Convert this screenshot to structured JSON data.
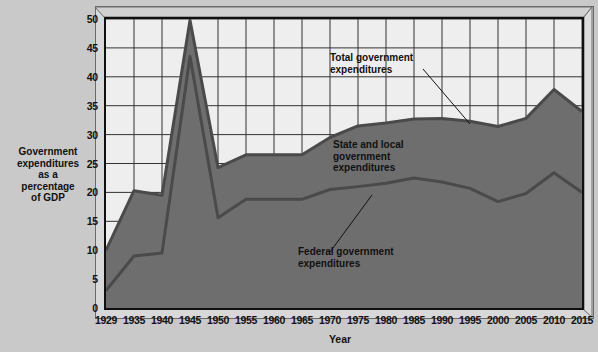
{
  "chart_data": {
    "type": "area",
    "title": "",
    "xlabel": "Year",
    "ylabel": "Government expenditures as a percentage of GDP",
    "ylim": [
      0,
      50
    ],
    "ytick_step": 5,
    "yticks": [
      0,
      5,
      10,
      15,
      20,
      25,
      30,
      35,
      40,
      45,
      50
    ],
    "grid": true,
    "legend_position": "inline-annotations",
    "categories": [
      1929,
      1935,
      1940,
      1945,
      1950,
      1955,
      1960,
      1965,
      1970,
      1975,
      1980,
      1985,
      1990,
      1995,
      2000,
      2005,
      2010,
      2015
    ],
    "xticks": [
      "1929",
      "1935",
      "1940",
      "1945",
      "1950",
      "1955",
      "1960",
      "1965",
      "1970",
      "1975",
      "1980",
      "1985",
      "1990",
      "1995",
      "2000",
      "2005",
      "2010",
      "2015"
    ],
    "series": [
      {
        "name": "Total government expenditures",
        "values": [
          10.0,
          20.3,
          19.5,
          49.8,
          24.3,
          26.5,
          26.5,
          26.5,
          29.5,
          31.5,
          32.0,
          32.7,
          32.8,
          32.3,
          31.4,
          32.8,
          37.8,
          34.0
        ]
      },
      {
        "name": "Federal government expenditures",
        "values": [
          3.0,
          9.0,
          9.5,
          43.5,
          15.6,
          18.8,
          18.8,
          18.8,
          20.5,
          21.0,
          21.6,
          22.5,
          21.8,
          20.7,
          18.4,
          19.8,
          23.4,
          20.0
        ]
      }
    ],
    "derived_series": [
      {
        "name": "State and local government expenditures",
        "description": "difference between total and federal government expenditures"
      }
    ],
    "annotations": [
      {
        "id": "total",
        "text": "Total government expenditures",
        "line_1": "Total government",
        "line_2": "expenditures"
      },
      {
        "id": "state-local",
        "text": "State and local government expenditures",
        "line_1": "State and local",
        "line_2": "government",
        "line_3": "expenditures"
      },
      {
        "id": "federal",
        "text": "Federal government expenditures",
        "line_1": "Federal government",
        "line_2": "expenditures"
      }
    ],
    "colors": {
      "plot_background": "#eeeeee",
      "area_fill": "#6e6e6e",
      "line": "#4a4a4a",
      "grid": "#333333",
      "axis": "#101010",
      "page_background": "#c9c9c9"
    }
  },
  "axis": {
    "y_title_lines": [
      "Government",
      "expenditures",
      "as a",
      "percentage",
      "of GDP"
    ],
    "x_title": "Year"
  }
}
